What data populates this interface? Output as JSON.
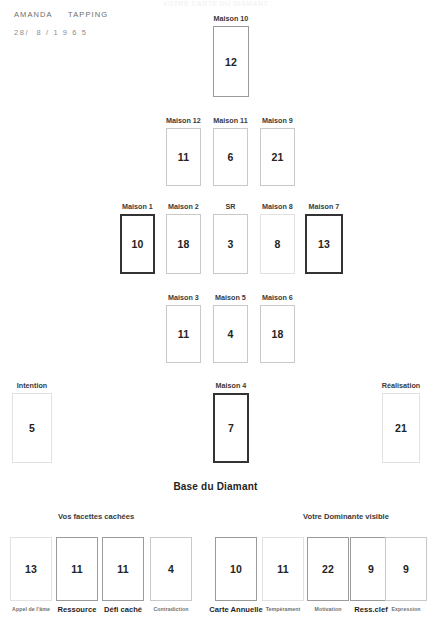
{
  "document": {
    "faint_top_title": "VOTRE CARTE DU DIAMANT"
  },
  "person": {
    "name": "AMANDA     TAPPING",
    "birthdate": "28/  8 / 1 9 6 5"
  },
  "headings": {
    "base_title": "Base du Diamant",
    "hidden_group": "Vos facettes cachées",
    "visible_group": "Votre Dominante visible"
  },
  "colors": {
    "ink": "#242424",
    "border_light": "#c9c9c9",
    "border_medium": "#9b9b9b",
    "border_bold": "#333333",
    "border_faint": "#e2e2e2",
    "page_background": "#ffffff"
  },
  "diamond": {
    "row_top": [
      {
        "label": "Maison 10",
        "value": "12",
        "border": "medium",
        "x": 213,
        "y": 26,
        "w": 36,
        "h": 71
      }
    ],
    "row_upper": [
      {
        "label": "Maison 12",
        "value": "11",
        "border": "light",
        "x": 166,
        "y": 128,
        "w": 35,
        "h": 58
      },
      {
        "label": "Maison 11",
        "value": "6",
        "border": "light",
        "x": 213,
        "y": 128,
        "w": 35,
        "h": 58
      },
      {
        "label": "Maison 9",
        "value": "21",
        "border": "light",
        "x": 260,
        "y": 128,
        "w": 35,
        "h": 58
      }
    ],
    "row_middle": [
      {
        "label": "Maison 1",
        "value": "10",
        "border": "bold",
        "x": 120,
        "y": 214,
        "w": 35,
        "h": 60
      },
      {
        "label": "Maison 2",
        "value": "18",
        "border": "light",
        "x": 166,
        "y": 214,
        "w": 35,
        "h": 60
      },
      {
        "label": "SR",
        "value": "3",
        "border": "light",
        "x": 213,
        "y": 214,
        "w": 35,
        "h": 60
      },
      {
        "label": "Maison 8",
        "value": "8",
        "border": "faint",
        "x": 260,
        "y": 214,
        "w": 35,
        "h": 60
      },
      {
        "label": "Maison 7",
        "value": "13",
        "border": "bold",
        "x": 305,
        "y": 214,
        "w": 38,
        "h": 60
      }
    ],
    "row_lower": [
      {
        "label": "Maison 3",
        "value": "11",
        "border": "light",
        "x": 166,
        "y": 305,
        "w": 35,
        "h": 58
      },
      {
        "label": "Maison 5",
        "value": "4",
        "border": "light",
        "x": 213,
        "y": 305,
        "w": 35,
        "h": 58
      },
      {
        "label": "Maison 6",
        "value": "18",
        "border": "light",
        "x": 260,
        "y": 305,
        "w": 35,
        "h": 58
      }
    ],
    "row_bottom": [
      {
        "label": "Intention",
        "value": "5",
        "border": "faint",
        "x": 12,
        "y": 393,
        "w": 40,
        "h": 70
      },
      {
        "label": "Maison 4",
        "value": "7",
        "border": "bold",
        "x": 213,
        "y": 393,
        "w": 36,
        "h": 70
      },
      {
        "label": "Réalisation",
        "value": "21",
        "border": "faint",
        "x": 382,
        "y": 393,
        "w": 38,
        "h": 70
      }
    ]
  },
  "base_du_diamant": {
    "hidden_facets": [
      {
        "caption": "Appel de l'âme",
        "value": "13",
        "border": "faint",
        "emphasis": "weak",
        "x": 10
      },
      {
        "caption": "Ressource",
        "value": "11",
        "border": "medium",
        "emphasis": "strong",
        "x": 56
      },
      {
        "caption": "Défi caché",
        "value": "11",
        "border": "medium",
        "emphasis": "strong",
        "x": 102
      },
      {
        "caption": "Contradiction",
        "value": "4",
        "border": "light",
        "emphasis": "weak",
        "x": 150
      }
    ],
    "visible_dominance": [
      {
        "caption": "Carte Annuelle",
        "value": "10",
        "border": "medium",
        "emphasis": "strong",
        "x": 215
      },
      {
        "caption": "Tempérament",
        "value": "11",
        "border": "faint",
        "emphasis": "weak",
        "x": 262
      },
      {
        "caption": "Motivation",
        "value": "22",
        "border": "medium",
        "emphasis": "weak",
        "x": 307
      },
      {
        "caption": "Ress.clef",
        "value": "9",
        "border": "medium",
        "emphasis": "strong",
        "x": 350
      },
      {
        "caption": "Expression",
        "value": "9",
        "border": "light",
        "emphasis": "weak",
        "x": 385
      }
    ]
  }
}
